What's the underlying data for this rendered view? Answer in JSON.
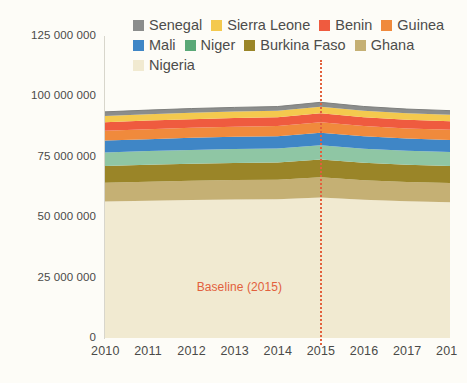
{
  "chart_data": {
    "type": "area",
    "stacked": true,
    "title": "",
    "subtitle": "",
    "xlabel": "",
    "ylabel": "",
    "grid": false,
    "legend_position": "top",
    "x": [
      2010,
      2011,
      2012,
      2013,
      2014,
      2015,
      2016,
      2017,
      2018
    ],
    "xtick_labels": [
      "2010",
      "2011",
      "2012",
      "2013",
      "2014",
      "2015",
      "2016",
      "2017",
      "201"
    ],
    "ylim": [
      0,
      125000000
    ],
    "ytick_values": [
      0,
      25000000,
      50000000,
      75000000,
      100000000,
      125000000
    ],
    "ytick_labels": [
      "0",
      "25 000 000",
      "50 000 000",
      "75 000 000",
      "100 000 000",
      "125 000 000"
    ],
    "series": [
      {
        "name": "Nigeria",
        "color": "#f1ead1",
        "values": [
          56500000,
          56800000,
          57100000,
          57300000,
          57400000,
          58200000,
          57200000,
          56600000,
          56200000
        ]
      },
      {
        "name": "Ghana",
        "color": "#c5b074",
        "values": [
          7800000,
          7900000,
          8000000,
          8050000,
          8100000,
          8300000,
          8100000,
          8000000,
          7950000
        ]
      },
      {
        "name": "Burkina Faso",
        "color": "#9a8528",
        "values": [
          6900000,
          7000000,
          7050000,
          7100000,
          7150000,
          7350000,
          7200000,
          7100000,
          7050000
        ]
      },
      {
        "name": "Niger",
        "color": "#8fc6a4",
        "values": [
          5600000,
          5650000,
          5700000,
          5750000,
          5800000,
          5950000,
          5850000,
          5780000,
          5740000
        ]
      },
      {
        "name": "Mali",
        "color": "#3f86c6",
        "values": [
          4900000,
          4950000,
          5000000,
          5050000,
          5080000,
          5200000,
          5120000,
          5060000,
          5030000
        ]
      },
      {
        "name": "Guinea",
        "color": "#f08a3c",
        "values": [
          4100000,
          4150000,
          4180000,
          4200000,
          4230000,
          4330000,
          4260000,
          4210000,
          4180000
        ]
      },
      {
        "name": "Benin",
        "color": "#ef5b3f",
        "values": [
          3500000,
          3530000,
          3560000,
          3580000,
          3600000,
          3680000,
          3620000,
          3580000,
          3560000
        ]
      },
      {
        "name": "Sierra Leone",
        "color": "#f4c94e",
        "values": [
          2600000,
          2630000,
          2650000,
          2670000,
          2690000,
          2750000,
          2710000,
          2680000,
          2660000
        ]
      },
      {
        "name": "Senegal",
        "color": "#8b8d8c",
        "values": [
          1700000,
          1720000,
          1730000,
          1740000,
          1750000,
          1790000,
          1760000,
          1740000,
          1730000
        ]
      }
    ],
    "annotations": [
      {
        "name": "baseline",
        "label": "Baseline (2015)",
        "x": 2015,
        "color": "#e2603c",
        "style": "dotted-vertical-line"
      }
    ]
  },
  "legend": {
    "items": [
      {
        "label": "Senegal",
        "color": "#8b8d8c"
      },
      {
        "label": "Sierra Leone",
        "color": "#f4c94e"
      },
      {
        "label": "Benin",
        "color": "#ef5b3f"
      },
      {
        "label": "Guinea",
        "color": "#f08a3c"
      },
      {
        "label": "Mali",
        "color": "#3f86c6"
      },
      {
        "label": "Niger",
        "color": "#5aa877"
      },
      {
        "label": "Burkina Faso",
        "color": "#9a8528"
      },
      {
        "label": "Ghana",
        "color": "#c5b074"
      },
      {
        "label": "Nigeria",
        "color": "#f1ead1"
      }
    ]
  }
}
